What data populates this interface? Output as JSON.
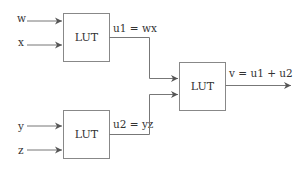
{
  "diagram": {
    "colors": {
      "line": "#777777",
      "box": "#888888",
      "text": "#333333",
      "background": "#ffffff"
    },
    "inputs": [
      {
        "id": "w",
        "label": "w"
      },
      {
        "id": "x",
        "label": "x"
      },
      {
        "id": "y",
        "label": "y"
      },
      {
        "id": "z",
        "label": "z"
      }
    ],
    "blocks": [
      {
        "id": "lut1",
        "label": "LUT",
        "output_label": "u1 = wx"
      },
      {
        "id": "lut2",
        "label": "LUT",
        "output_label": "u2 = yz"
      },
      {
        "id": "lut3",
        "label": "LUT",
        "output_label": "v = u1 + u2"
      }
    ]
  }
}
